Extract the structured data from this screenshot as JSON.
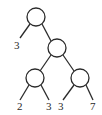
{
  "diagram": {
    "type": "binary-tree",
    "colors": {
      "stroke": "#2a2a2a",
      "background": "#ffffff"
    },
    "nodes": [
      {
        "id": "root",
        "cx": 36,
        "cy": 17,
        "r": 9
      },
      {
        "id": "right-internal",
        "cx": 57,
        "cy": 48,
        "r": 9
      },
      {
        "id": "bottom-left-internal",
        "cx": 35,
        "cy": 78,
        "r": 9
      },
      {
        "id": "bottom-right-internal",
        "cx": 80,
        "cy": 78,
        "r": 9
      }
    ],
    "leaves": [
      {
        "id": "leaf-root-left",
        "label": "3",
        "x": 14,
        "y": 49
      },
      {
        "id": "leaf-bl-left",
        "label": "2",
        "x": 17,
        "y": 110
      },
      {
        "id": "leaf-bl-right",
        "label": "3",
        "x": 46,
        "y": 110
      },
      {
        "id": "leaf-br-left",
        "label": "3",
        "x": 58,
        "y": 110
      },
      {
        "id": "leaf-br-right",
        "label": "7",
        "x": 90,
        "y": 110
      }
    ],
    "edges": [
      {
        "from": "root",
        "x1": 30,
        "y1": 24,
        "x2": 20,
        "y2": 38
      },
      {
        "from": "root",
        "x1": 42,
        "y1": 24,
        "x2": 51,
        "y2": 41
      },
      {
        "from": "right-internal",
        "x1": 51,
        "y1": 55,
        "x2": 40,
        "y2": 71
      },
      {
        "from": "right-internal",
        "x1": 63,
        "y1": 55,
        "x2": 74,
        "y2": 71
      },
      {
        "from": "bottom-left-internal",
        "x1": 29,
        "y1": 85,
        "x2": 20,
        "y2": 100
      },
      {
        "from": "bottom-left-internal",
        "x1": 41,
        "y1": 85,
        "x2": 49,
        "y2": 100
      },
      {
        "from": "bottom-right-internal",
        "x1": 74,
        "y1": 85,
        "x2": 63,
        "y2": 100
      },
      {
        "from": "bottom-right-internal",
        "x1": 86,
        "y1": 85,
        "x2": 93,
        "y2": 100
      }
    ]
  }
}
